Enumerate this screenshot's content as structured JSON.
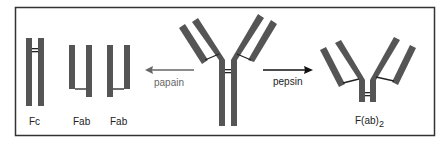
{
  "colors": {
    "chain": "#555555",
    "frame": "#333333",
    "papain_arrow": "#666666",
    "pepsin_arrow": "#111111",
    "background": "#ffffff"
  },
  "fragments": {
    "fc": "Fc",
    "fab1": "Fab",
    "fab2": "Fab",
    "fab2_fragment": "F(ab)",
    "fab2_subscript": "2"
  },
  "enzymes": {
    "papain": "papain",
    "pepsin": "pepsin"
  }
}
